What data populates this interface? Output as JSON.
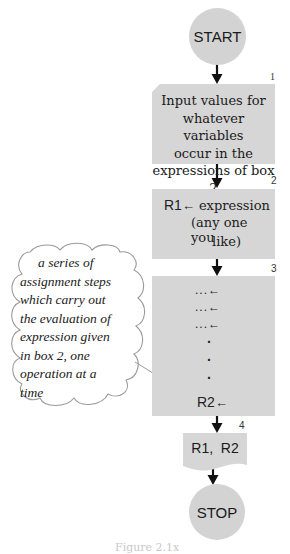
{
  "flowchart": {
    "start": {
      "label": "START"
    },
    "box1": {
      "number": "1",
      "lines": [
        "Input values for",
        "whatever variables",
        "occur in the",
        "expressions of box 2"
      ]
    },
    "box2": {
      "number": "2",
      "register": "R1",
      "arrow": "←",
      "lines": [
        "expression",
        "(any one you",
        "like)"
      ]
    },
    "box3": {
      "number": "3",
      "rows": [
        "...←",
        "...←",
        "...←"
      ],
      "vertical_dots": [
        "·",
        "·",
        "·"
      ],
      "last_register": "R2",
      "arrow": "←"
    },
    "box4": {
      "number": "4",
      "label": "R1,  R2"
    },
    "stop": {
      "label": "STOP"
    },
    "annotation": {
      "lines": [
        "a series of",
        "assignment steps",
        "which carry out",
        "the evaluation of",
        "expression given",
        "in box 2, one",
        "operation at a",
        "time"
      ]
    },
    "caption": "Figure 2.1x"
  },
  "colors": {
    "fill": "#d3d3d3",
    "arrow": "#111111",
    "text": "#1a1a1a"
  }
}
